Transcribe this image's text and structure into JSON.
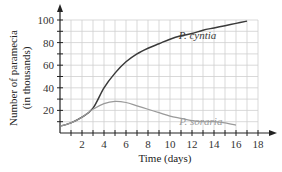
{
  "chart_data": {
    "type": "line",
    "title": "",
    "xlabel": "Time (days)",
    "ylabel": "Number of paramecia (in thousands)",
    "ylabel_lines": [
      "Number of paramecia",
      "(in thousands)"
    ],
    "xlim": [
      0,
      18
    ],
    "ylim": [
      0,
      100
    ],
    "x_ticks": [
      2,
      4,
      6,
      8,
      10,
      12,
      14,
      16,
      18
    ],
    "y_ticks": [
      20,
      40,
      60,
      80,
      100
    ],
    "grid": true,
    "grid_x_step": 1,
    "grid_y_step": 10,
    "legend": "inline labels",
    "series": [
      {
        "name": "P. cyntia",
        "color": "#3a3a3a",
        "x": [
          0,
          1,
          2,
          3,
          4,
          5,
          6,
          7,
          8,
          9,
          10,
          11,
          12,
          13,
          14,
          15,
          16,
          17
        ],
        "values": [
          6,
          9,
          14,
          22,
          40,
          53,
          63,
          70,
          75,
          79,
          83,
          86,
          88,
          91,
          93,
          95,
          97,
          99
        ]
      },
      {
        "name": "P. soraria",
        "color": "#9a9a9a",
        "x": [
          0,
          1,
          2,
          3,
          4,
          5,
          6,
          7,
          8,
          9,
          10,
          11,
          12,
          13,
          14,
          15,
          16
        ],
        "values": [
          6,
          9,
          14,
          21,
          26,
          28,
          27,
          24,
          21,
          18,
          15,
          13,
          11,
          10,
          10,
          9,
          7
        ]
      }
    ],
    "annotations": [
      {
        "text": "P. cyntia",
        "x": 12.5,
        "y": 87
      },
      {
        "text": "P. soraria",
        "x": 12.8,
        "y": 11
      }
    ]
  },
  "colors": {
    "grid": "#cfcfcf",
    "axis": "#222222"
  }
}
